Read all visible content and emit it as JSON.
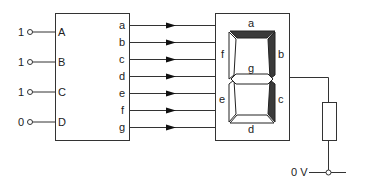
{
  "diagram": {
    "inputs": [
      {
        "name": "A",
        "value": "1"
      },
      {
        "name": "B",
        "value": "1"
      },
      {
        "name": "C",
        "value": "1"
      },
      {
        "name": "D",
        "value": "0"
      }
    ],
    "decoder_outputs": [
      "a",
      "b",
      "c",
      "d",
      "e",
      "f",
      "g"
    ],
    "display_segments": {
      "a": {
        "label": "a",
        "lit": true
      },
      "b": {
        "label": "b",
        "lit": true
      },
      "c": {
        "label": "c",
        "lit": true
      },
      "d": {
        "label": "d",
        "lit": false
      },
      "e": {
        "label": "e",
        "lit": false
      },
      "f": {
        "label": "f",
        "lit": false
      },
      "g": {
        "label": "g",
        "lit": false
      }
    },
    "ground_label": "0 V",
    "colors": {
      "lit_segment": "#3a3a3a",
      "unlit_segment": "#ffffff",
      "line": "#333333"
    }
  }
}
